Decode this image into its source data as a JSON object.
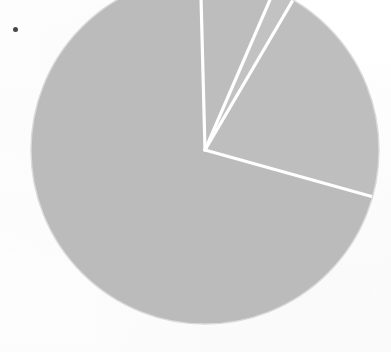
{
  "figure": {
    "kind": "pie-chart",
    "title": "",
    "background_color": "#ffffff",
    "bullet_marker": "•",
    "rendering": "grayscale scanned halftone"
  },
  "geometry": {
    "center_x": 205,
    "center_y": 150,
    "radius": 174,
    "clipped_top": true,
    "separator_color": "#ffffff",
    "separator_width_px": 3.2,
    "outline_color": "#d8d8d8"
  },
  "chart_data": {
    "type": "pie",
    "title": "",
    "subtitle": "",
    "xlabel": "",
    "ylabel": "",
    "legend": [],
    "legend_position": "none",
    "grid": false,
    "labels": [
      "Slice 1",
      "Slice 2",
      "Slice 3",
      "Slice 4"
    ],
    "values": [
      6.9,
      1.9,
      20.9,
      70.3
    ],
    "units": "percent",
    "start_angle_deg": -1.5,
    "direction": "clockwise",
    "slices": [
      {
        "name": "Slice 1",
        "value": 6.9,
        "angle_deg": 24.9,
        "start_deg": -1.5,
        "end_deg": 23.4,
        "color": "#bdbdbd"
      },
      {
        "name": "Slice 2",
        "value": 1.9,
        "angle_deg": 7.0,
        "start_deg": 23.4,
        "end_deg": 30.4,
        "color": "#c2c2c2"
      },
      {
        "name": "Slice 3",
        "value": 20.9,
        "angle_deg": 75.2,
        "start_deg": 30.4,
        "end_deg": 105.6,
        "color": "#bebebe"
      },
      {
        "name": "Slice 4",
        "value": 70.3,
        "angle_deg": 252.9,
        "start_deg": 105.6,
        "end_deg": 358.5,
        "color": "#bbbbbb"
      }
    ],
    "annotations": []
  }
}
